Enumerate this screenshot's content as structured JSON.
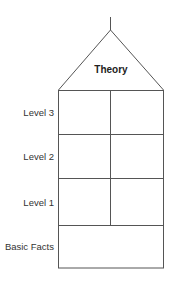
{
  "diagram": {
    "roof_label": "Theory",
    "levels": [
      {
        "label": "Level 3",
        "columns": 2
      },
      {
        "label": "Level 2",
        "columns": 2
      },
      {
        "label": "Level 1",
        "columns": 2
      },
      {
        "label": "Basic Facts",
        "columns": 1
      }
    ],
    "line_color": "#555555"
  }
}
